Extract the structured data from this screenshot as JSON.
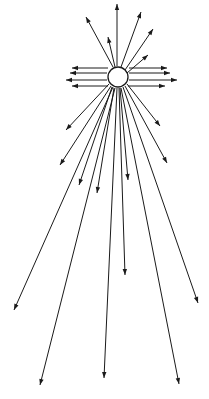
{
  "diagram": {
    "title": "",
    "colors": {
      "ink": "#1a1a1a",
      "background": "#ffffff"
    },
    "source": {
      "name": "source-circle",
      "shape": "circle"
    },
    "groups": [
      {
        "name": "upper-rays",
        "count": 6
      },
      {
        "name": "left-horizontal-rays",
        "count": 4
      },
      {
        "name": "right-horizontal-rays",
        "count": 4
      },
      {
        "name": "lower-beam-rays",
        "count": 14
      }
    ]
  }
}
